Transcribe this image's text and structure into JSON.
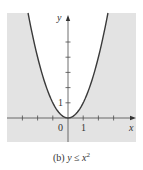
{
  "chart_data": {
    "type": "area",
    "title": "",
    "caption": "(b) y ≤ x²",
    "caption_parts": {
      "prefix": "(b)",
      "lhs": "y",
      "op": "≤",
      "rhs_base": "x",
      "rhs_exp": "2"
    },
    "curve": {
      "equation": "y = x^2",
      "x": [
        -2.6,
        -2,
        -1.5,
        -1,
        -0.5,
        0,
        0.5,
        1,
        1.5,
        2,
        2.6
      ],
      "y": [
        6.76,
        4,
        2.25,
        1,
        0.25,
        0,
        0.25,
        1,
        2.25,
        4,
        6.76
      ]
    },
    "shaded_region": "y <= x^2",
    "xlabel": "x",
    "ylabel": "y",
    "x_tick_labels": [
      "0",
      "1"
    ],
    "y_tick_labels": [
      "1"
    ],
    "xlim": [
      -4,
      4.4
    ],
    "ylim": [
      -1.6,
      6.9
    ],
    "x_ticks": [
      -3,
      -2,
      -1,
      1,
      2,
      3
    ],
    "y_ticks": [
      1,
      2,
      3,
      4,
      5
    ],
    "grid": false,
    "legend": null,
    "colors": {
      "shade": "#e3e3e3",
      "curve": "#3a3a3a",
      "axis": "#4a4a4a",
      "background": "#ffffff"
    }
  }
}
